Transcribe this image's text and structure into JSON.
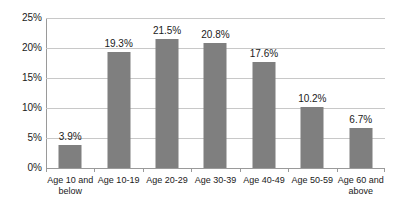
{
  "chart_data": {
    "type": "bar",
    "title": "",
    "subtitle": "",
    "xlabel": "",
    "ylabel": "",
    "ylim": [
      0,
      25
    ],
    "ytick_labels": [
      "0%",
      "5%",
      "10%",
      "15%",
      "20%",
      "25%"
    ],
    "ytick_values": [
      0,
      5,
      10,
      15,
      20,
      25
    ],
    "grid": true,
    "legend": false,
    "legend_position": "none",
    "categories": [
      "Age 10 and below",
      "Age 10-19",
      "Age 20-29",
      "Age 30-39",
      "Age 40-49",
      "Age 50-59",
      "Age 60 and above"
    ],
    "category_label_lines": [
      [
        "Age 10 and",
        "below"
      ],
      [
        "Age 10-19",
        ""
      ],
      [
        "Age 20-29",
        ""
      ],
      [
        "Age 30-39",
        ""
      ],
      [
        "Age 40-49",
        ""
      ],
      [
        "Age 50-59",
        ""
      ],
      [
        "Age 60 and",
        "above"
      ]
    ],
    "values": [
      3.9,
      19.3,
      21.5,
      20.8,
      17.6,
      10.2,
      6.7
    ],
    "data_labels": [
      "3.9%",
      "19.3%",
      "21.5%",
      "20.8%",
      "17.6%",
      "10.2%",
      "6.7%"
    ],
    "series": [
      {
        "name": "",
        "values": [
          3.9,
          19.3,
          21.5,
          20.8,
          17.6,
          10.2,
          6.7
        ],
        "color": "#7f7f7f"
      }
    ],
    "colors": {
      "bar_fill": "#7f7f7f",
      "gridline": "#c8c8c8",
      "axis_line": "#9a9a9a",
      "background": "#ffffff",
      "text": "#1a1a1a"
    }
  }
}
